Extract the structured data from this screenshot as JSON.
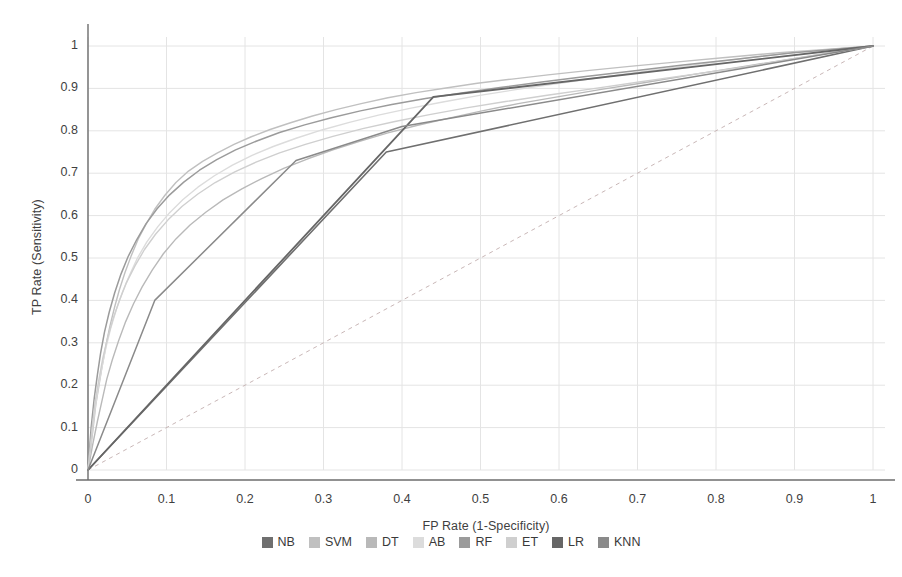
{
  "chart_data": {
    "type": "line",
    "title": "",
    "xlabel": "FP Rate (1-Specificity)",
    "ylabel": "TP Rate (Sensitivity)",
    "xlim": [
      0,
      1
    ],
    "ylim": [
      0,
      1
    ],
    "xticks": [
      "0",
      "0.1",
      "0.2",
      "0.3",
      "0.4",
      "0.5",
      "0.6",
      "0.7",
      "0.8",
      "0.9",
      "1"
    ],
    "yticks": [
      "0",
      "0.1",
      "0.2",
      "0.3",
      "0.4",
      "0.5",
      "0.6",
      "0.7",
      "0.8",
      "0.9",
      "1"
    ],
    "grid": true,
    "legend_position": "bottom",
    "reference_line": {
      "name": "chance-diagonal",
      "style": "dashed",
      "color": "#c9b7b7",
      "points": [
        [
          0,
          0
        ],
        [
          1,
          1
        ]
      ]
    },
    "series": [
      {
        "name": "NB",
        "color": "#6f6f6f",
        "width": 1.6,
        "points": [
          [
            0,
            0
          ],
          [
            0.38,
            0.75
          ],
          [
            1,
            1
          ]
        ]
      },
      {
        "name": "SVM",
        "color": "#c0c0c0",
        "width": 1.4,
        "points": [
          [
            0,
            0
          ],
          [
            0.006,
            0.09
          ],
          [
            0.01,
            0.155
          ],
          [
            0.014,
            0.2
          ],
          [
            0.018,
            0.245
          ],
          [
            0.023,
            0.295
          ],
          [
            0.028,
            0.34
          ],
          [
            0.034,
            0.385
          ],
          [
            0.04,
            0.425
          ],
          [
            0.047,
            0.465
          ],
          [
            0.055,
            0.505
          ],
          [
            0.064,
            0.545
          ],
          [
            0.074,
            0.58
          ],
          [
            0.085,
            0.615
          ],
          [
            0.098,
            0.648
          ],
          [
            0.112,
            0.678
          ],
          [
            0.128,
            0.705
          ],
          [
            0.146,
            0.728
          ],
          [
            0.165,
            0.748
          ],
          [
            0.186,
            0.768
          ],
          [
            0.208,
            0.786
          ],
          [
            0.232,
            0.803
          ],
          [
            0.258,
            0.819
          ],
          [
            0.286,
            0.835
          ],
          [
            0.316,
            0.85
          ],
          [
            0.348,
            0.864
          ],
          [
            0.382,
            0.878
          ],
          [
            0.418,
            0.89
          ],
          [
            0.456,
            0.901
          ],
          [
            0.496,
            0.912
          ],
          [
            0.54,
            0.922
          ],
          [
            0.586,
            0.932
          ],
          [
            0.636,
            0.942
          ],
          [
            0.69,
            0.952
          ],
          [
            0.748,
            0.962
          ],
          [
            0.812,
            0.973
          ],
          [
            0.88,
            0.984
          ],
          [
            0.94,
            0.992
          ],
          [
            1,
            1
          ]
        ]
      },
      {
        "name": "DT",
        "color": "#b9b9b9",
        "width": 1.4,
        "points": [
          [
            0,
            0
          ],
          [
            0.006,
            0.06
          ],
          [
            0.012,
            0.115
          ],
          [
            0.018,
            0.165
          ],
          [
            0.024,
            0.215
          ],
          [
            0.031,
            0.26
          ],
          [
            0.039,
            0.305
          ],
          [
            0.048,
            0.35
          ],
          [
            0.058,
            0.392
          ],
          [
            0.069,
            0.432
          ],
          [
            0.082,
            0.472
          ],
          [
            0.096,
            0.51
          ],
          [
            0.112,
            0.545
          ],
          [
            0.13,
            0.578
          ],
          [
            0.15,
            0.608
          ],
          [
            0.172,
            0.637
          ],
          [
            0.196,
            0.663
          ],
          [
            0.222,
            0.688
          ],
          [
            0.25,
            0.712
          ],
          [
            0.28,
            0.734
          ],
          [
            0.312,
            0.755
          ],
          [
            0.346,
            0.775
          ],
          [
            0.382,
            0.795
          ],
          [
            0.42,
            0.813
          ],
          [
            0.46,
            0.83
          ],
          [
            0.502,
            0.847
          ],
          [
            0.548,
            0.864
          ],
          [
            0.598,
            0.88
          ],
          [
            0.652,
            0.897
          ],
          [
            0.71,
            0.914
          ],
          [
            0.772,
            0.933
          ],
          [
            0.84,
            0.953
          ],
          [
            0.912,
            0.974
          ],
          [
            1,
            1
          ]
        ]
      },
      {
        "name": "AB",
        "color": "#dcdcdc",
        "width": 1.4,
        "points": [
          [
            0,
            0
          ],
          [
            0.005,
            0.085
          ],
          [
            0.009,
            0.145
          ],
          [
            0.013,
            0.195
          ],
          [
            0.018,
            0.245
          ],
          [
            0.023,
            0.29
          ],
          [
            0.029,
            0.335
          ],
          [
            0.036,
            0.378
          ],
          [
            0.044,
            0.42
          ],
          [
            0.053,
            0.46
          ],
          [
            0.063,
            0.5
          ],
          [
            0.075,
            0.538
          ],
          [
            0.089,
            0.574
          ],
          [
            0.104,
            0.607
          ],
          [
            0.121,
            0.638
          ],
          [
            0.14,
            0.667
          ],
          [
            0.161,
            0.694
          ],
          [
            0.184,
            0.719
          ],
          [
            0.209,
            0.742
          ],
          [
            0.236,
            0.763
          ],
          [
            0.266,
            0.783
          ],
          [
            0.298,
            0.802
          ],
          [
            0.333,
            0.82
          ],
          [
            0.37,
            0.837
          ],
          [
            0.41,
            0.853
          ],
          [
            0.452,
            0.868
          ],
          [
            0.497,
            0.883
          ],
          [
            0.545,
            0.897
          ],
          [
            0.596,
            0.911
          ],
          [
            0.65,
            0.925
          ],
          [
            0.708,
            0.94
          ],
          [
            0.77,
            0.955
          ],
          [
            0.836,
            0.971
          ],
          [
            0.906,
            0.986
          ],
          [
            1,
            1
          ]
        ]
      },
      {
        "name": "RF",
        "color": "#9b9b9b",
        "width": 1.5,
        "points": [
          [
            0,
            0
          ],
          [
            0.004,
            0.1
          ],
          [
            0.008,
            0.17
          ],
          [
            0.012,
            0.225
          ],
          [
            0.016,
            0.275
          ],
          [
            0.021,
            0.325
          ],
          [
            0.027,
            0.372
          ],
          [
            0.034,
            0.418
          ],
          [
            0.042,
            0.462
          ],
          [
            0.051,
            0.503
          ],
          [
            0.062,
            0.543
          ],
          [
            0.074,
            0.581
          ],
          [
            0.088,
            0.616
          ],
          [
            0.104,
            0.649
          ],
          [
            0.122,
            0.679
          ],
          [
            0.142,
            0.707
          ],
          [
            0.164,
            0.732
          ],
          [
            0.188,
            0.755
          ],
          [
            0.215,
            0.776
          ],
          [
            0.244,
            0.796
          ],
          [
            0.276,
            0.814
          ],
          [
            0.31,
            0.831
          ],
          [
            0.347,
            0.847
          ],
          [
            0.387,
            0.862
          ],
          [
            0.43,
            0.876
          ],
          [
            0.476,
            0.889
          ],
          [
            0.525,
            0.902
          ],
          [
            0.578,
            0.915
          ],
          [
            0.634,
            0.928
          ],
          [
            0.694,
            0.941
          ],
          [
            0.758,
            0.955
          ],
          [
            0.826,
            0.969
          ],
          [
            0.898,
            0.984
          ],
          [
            1,
            1
          ]
        ]
      },
      {
        "name": "ET",
        "color": "#cfcfcf",
        "width": 1.4,
        "points": [
          [
            0,
            0
          ],
          [
            0.005,
            0.095
          ],
          [
            0.009,
            0.16
          ],
          [
            0.014,
            0.215
          ],
          [
            0.019,
            0.265
          ],
          [
            0.025,
            0.312
          ],
          [
            0.032,
            0.357
          ],
          [
            0.04,
            0.4
          ],
          [
            0.049,
            0.442
          ],
          [
            0.06,
            0.482
          ],
          [
            0.072,
            0.52
          ],
          [
            0.086,
            0.556
          ],
          [
            0.102,
            0.59
          ],
          [
            0.12,
            0.622
          ],
          [
            0.14,
            0.651
          ],
          [
            0.162,
            0.678
          ],
          [
            0.187,
            0.703
          ],
          [
            0.214,
            0.726
          ],
          [
            0.244,
            0.748
          ],
          [
            0.277,
            0.768
          ],
          [
            0.312,
            0.787
          ],
          [
            0.35,
            0.805
          ],
          [
            0.391,
            0.822
          ],
          [
            0.435,
            0.838
          ],
          [
            0.482,
            0.854
          ],
          [
            0.532,
            0.869
          ],
          [
            0.585,
            0.884
          ],
          [
            0.642,
            0.899
          ],
          [
            0.702,
            0.915
          ],
          [
            0.766,
            0.932
          ],
          [
            0.834,
            0.95
          ],
          [
            0.906,
            0.972
          ],
          [
            1,
            1
          ]
        ]
      },
      {
        "name": "LR",
        "color": "#666666",
        "width": 1.8,
        "points": [
          [
            0,
            0
          ],
          [
            0.44,
            0.88
          ],
          [
            1,
            1
          ]
        ]
      },
      {
        "name": "KNN",
        "color": "#8a8a8a",
        "width": 1.5,
        "points": [
          [
            0,
            0
          ],
          [
            0.085,
            0.4
          ],
          [
            0.265,
            0.73
          ],
          [
            0.4,
            0.81
          ],
          [
            1,
            1
          ]
        ]
      }
    ]
  },
  "legend": {
    "items": [
      {
        "label": "NB",
        "color": "#6f6f6f"
      },
      {
        "label": "SVM",
        "color": "#c0c0c0"
      },
      {
        "label": "DT",
        "color": "#b9b9b9"
      },
      {
        "label": "AB",
        "color": "#dcdcdc"
      },
      {
        "label": "RF",
        "color": "#9b9b9b"
      },
      {
        "label": "ET",
        "color": "#cfcfcf"
      },
      {
        "label": "LR",
        "color": "#666666"
      },
      {
        "label": "KNN",
        "color": "#8a8a8a"
      }
    ]
  },
  "colors": {
    "background": "#ffffff",
    "grid": "#e4e4e4",
    "axis": "#6d6d6d",
    "text": "#3a3a3a",
    "diagonal": "#c9b7b7"
  }
}
